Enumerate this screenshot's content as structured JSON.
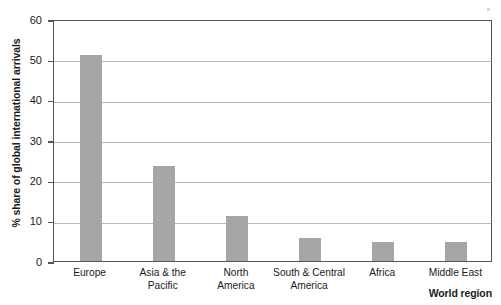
{
  "chart_data": {
    "type": "bar",
    "title": "",
    "xlabel": "World region",
    "ylabel": "% share of global international arrivals",
    "categories": [
      "Europe",
      "Asia & the\nPacific",
      "North\nAmerica",
      "South & Central\nAmerica",
      "Africa",
      "Middle East"
    ],
    "values": [
      51,
      23.5,
      11.2,
      5.7,
      4.8,
      4.7
    ],
    "ylim": [
      0,
      60
    ],
    "ytick_labels": [
      "60",
      "50",
      "40",
      "30",
      "20",
      "10",
      "0"
    ],
    "ytick_values": [
      60,
      50,
      40,
      30,
      20,
      10,
      0
    ],
    "grid": true,
    "legend": "none",
    "bar_color": "#a6a6a6",
    "axis_color": "#555555",
    "grid_color": "#b9b9b9"
  }
}
